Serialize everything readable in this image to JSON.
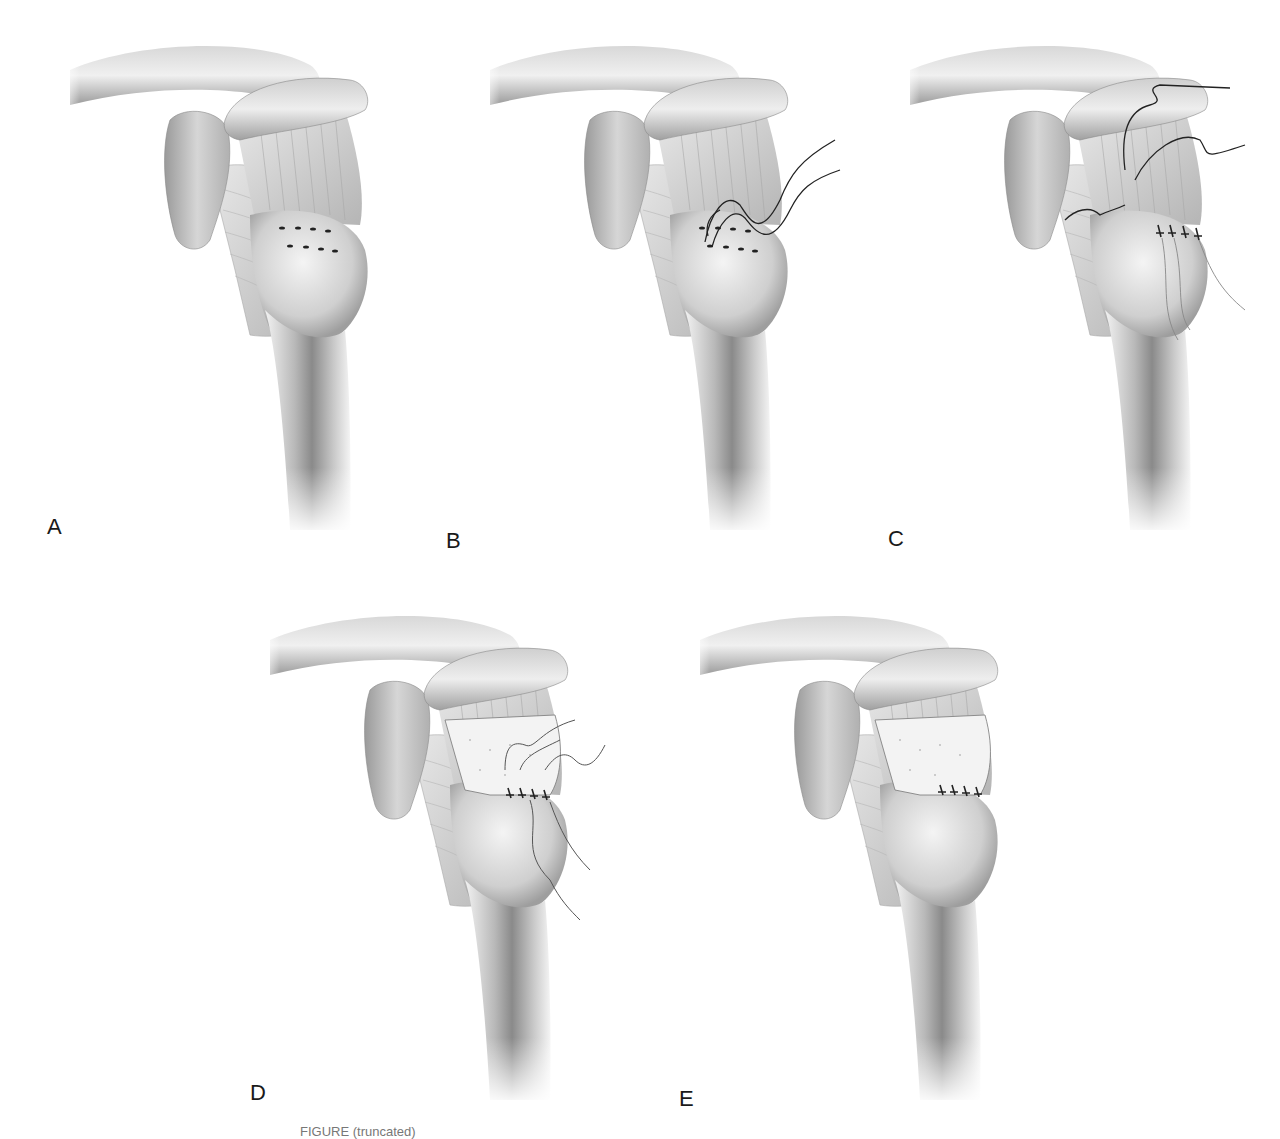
{
  "figure": {
    "panels": [
      {
        "id": "A",
        "label": "A",
        "stage": "bone-bed-with-drill-holes"
      },
      {
        "id": "B",
        "label": "B",
        "stage": "sutures-passed-through-holes"
      },
      {
        "id": "C",
        "label": "C",
        "stage": "tendon-repaired-with-sutures"
      },
      {
        "id": "D",
        "label": "D",
        "stage": "graft-patch-being-sutured"
      },
      {
        "id": "E",
        "label": "E",
        "stage": "graft-patch-secured"
      }
    ],
    "caption": "FIGURE (truncated)"
  },
  "colors": {
    "background": "#ffffff",
    "bone_light": "#e6e6e6",
    "bone_mid": "#bdbdbd",
    "bone_dark": "#7a7a7a",
    "suture": "#222222",
    "label": "#1a1a1a"
  }
}
